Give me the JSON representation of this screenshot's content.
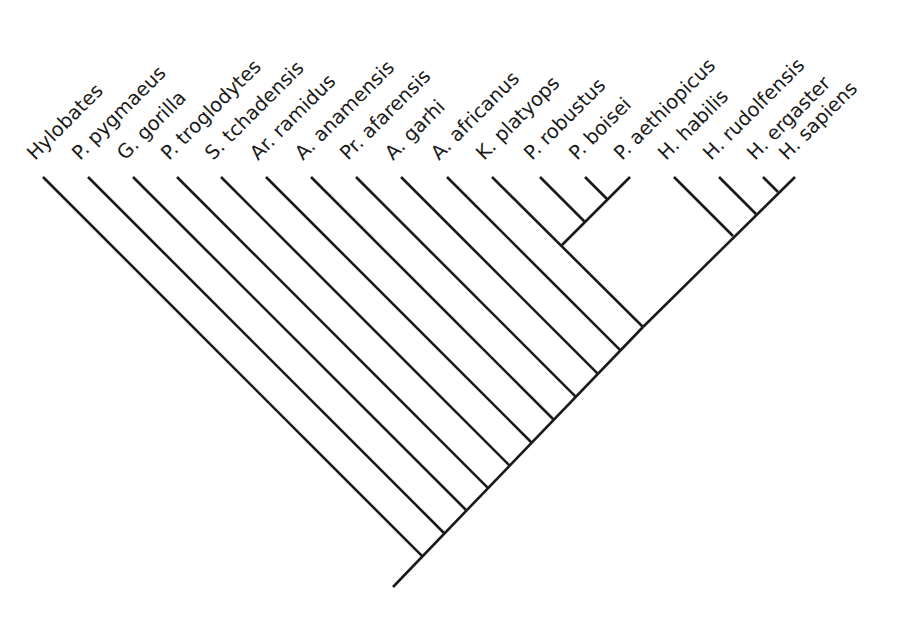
{
  "diagram": {
    "type": "cladogram",
    "orientation": "tips-up, root-bottom, diagonal (45deg) ladder",
    "line_color": "#1a1a1a",
    "background": "#ffffff",
    "tip_y": 177,
    "label_baseline_y": 161,
    "label_rotation_deg": -45,
    "root": {
      "x": 393,
      "y": 587
    },
    "backbone_end": {
      "x": 795,
      "y": 177
    },
    "taxa": [
      {
        "id": "hylobates",
        "label": "Hylobates",
        "tip_x": 43
      },
      {
        "id": "p-pygmaeus",
        "label": "P. pygmaeus",
        "tip_x": 88
      },
      {
        "id": "g-gorilla",
        "label": "G. gorilla",
        "tip_x": 133
      },
      {
        "id": "p-troglodytes",
        "label": "P. troglodytes",
        "tip_x": 177
      },
      {
        "id": "s-tchadensis",
        "label": "S. tchadensis",
        "tip_x": 221
      },
      {
        "id": "ar-ramidus",
        "label": "Ar. ramidus",
        "tip_x": 266
      },
      {
        "id": "a-anamensis",
        "label": "A. anamensis",
        "tip_x": 311
      },
      {
        "id": "pr-afarensis",
        "label": "Pr. afarensis",
        "tip_x": 356
      },
      {
        "id": "a-garhi",
        "label": "A. garhi",
        "tip_x": 401
      },
      {
        "id": "a-africanus",
        "label": "A. africanus",
        "tip_x": 447
      },
      {
        "id": "k-platyops",
        "label": "K. platyops",
        "tip_x": 492
      },
      {
        "id": "p-robustus",
        "label": "P. robustus",
        "tip_x": 540
      },
      {
        "id": "p-boisei",
        "label": "P. boisei",
        "tip_x": 585
      },
      {
        "id": "p-aethiopicus",
        "label": "P. aethiopicus",
        "tip_x": 630
      },
      {
        "id": "h-habilis",
        "label": "H. habilis",
        "tip_x": 674
      },
      {
        "id": "h-rudolfensis",
        "label": "H. rudolfensis",
        "tip_x": 719
      },
      {
        "id": "h-ergaster",
        "label": "H. ergaster",
        "tip_x": 763
      },
      {
        "id": "h-sapiens",
        "label": "H. sapiens",
        "tip_x": 795
      }
    ],
    "clades": [
      {
        "name": "Paranthropus",
        "members": [
          "P. robustus",
          "P. boisei",
          "P. aethiopicus"
        ],
        "segments": [
          [
            630,
            177,
            562,
            245
          ],
          [
            540,
            177,
            585,
            222
          ],
          [
            585,
            177,
            607,
            199
          ]
        ]
      },
      {
        "name": "Homo",
        "members": [
          "H. habilis",
          "H. rudolfensis",
          "H. ergaster",
          "H. sapiens"
        ],
        "segments": [
          [
            674,
            177,
            733,
            236
          ],
          [
            719,
            177,
            756,
            214
          ],
          [
            763,
            177,
            778,
            192
          ]
        ]
      }
    ],
    "extra_segments": [
      [
        562,
        245,
        643,
        327
      ]
    ],
    "backbone_leaves": [
      "Hylobates",
      "P. pygmaeus",
      "G. gorilla",
      "P. troglodytes",
      "S. tchadensis",
      "Ar. ramidus",
      "A. anamensis",
      "Pr. afarensis",
      "A. garhi",
      "A. africanus"
    ],
    "k_platyops_attaches_to_paranthropus_stem": true
  }
}
